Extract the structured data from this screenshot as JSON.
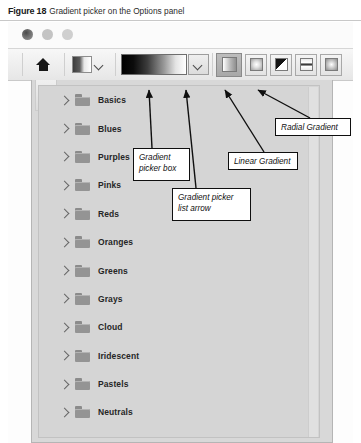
{
  "caption": {
    "figure_number": "Figure 18",
    "text": "Gradient picker on the Options panel"
  },
  "window": {
    "traffic_lights": [
      "close-dot",
      "minimize-dot",
      "zoom-dot"
    ]
  },
  "toolbar": {
    "home_icon": "home-icon",
    "preset_swatch": "gradient-preset-swatch",
    "preset_dropdown_icon": "chevron-down-icon",
    "gradient_picker_box": "gradient-preview-swatch",
    "gradient_picker_list_arrow_icon": "chevron-down-icon",
    "gradient_types": [
      {
        "name": "linear-gradient-button",
        "icon": "linear-gradient-icon",
        "selected": true
      },
      {
        "name": "radial-gradient-button",
        "icon": "radial-gradient-icon",
        "selected": false
      },
      {
        "name": "angle-gradient-button",
        "icon": "angle-gradient-icon",
        "selected": false
      },
      {
        "name": "reflected-gradient-button",
        "icon": "reflected-gradient-icon",
        "selected": false
      },
      {
        "name": "diamond-gradient-button",
        "icon": "diamond-gradient-icon",
        "selected": false
      }
    ]
  },
  "picker": {
    "folders": [
      {
        "label": "Basics"
      },
      {
        "label": "Blues"
      },
      {
        "label": "Purples"
      },
      {
        "label": "Pinks"
      },
      {
        "label": "Reds"
      },
      {
        "label": "Oranges"
      },
      {
        "label": "Greens"
      },
      {
        "label": "Grays"
      },
      {
        "label": "Cloud"
      },
      {
        "label": "Iridescent"
      },
      {
        "label": "Pastels"
      },
      {
        "label": "Neutrals"
      }
    ],
    "expand_icon": "chevron-right-icon",
    "folder_icon": "folder-icon"
  },
  "annotations": [
    {
      "id": "gradient-picker-box",
      "line1": "Gradient",
      "line2": "picker box"
    },
    {
      "id": "gradient-picker-list-arrow",
      "line1": "Gradient picker",
      "line2": "list arrow"
    },
    {
      "id": "linear-gradient",
      "line1": "Linear Gradient",
      "line2": ""
    },
    {
      "id": "radial-gradient",
      "line1": "Radial Gradient",
      "line2": ""
    }
  ],
  "colors": {
    "callout_border": "#0f0f0f",
    "callout_bg": "#ffffff",
    "panel_bg": "#d5d5d5",
    "toolbar_bg": "#eeeeee",
    "selected_button_bg": "#b0b0b0"
  }
}
